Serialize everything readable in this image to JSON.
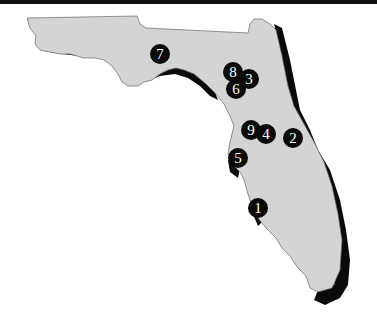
{
  "map": {
    "region": "Florida",
    "colors": {
      "land": "#d4d4d4",
      "shadow": "#0a0a0a",
      "outline": "#666666",
      "marker": "#0a0a0a",
      "marker_text": "#ffffff",
      "top_bar": "#111111"
    },
    "markers": [
      {
        "label": "1",
        "x": 258,
        "y": 208
      },
      {
        "label": "2",
        "x": 293,
        "y": 138
      },
      {
        "label": "3",
        "x": 249,
        "y": 79
      },
      {
        "label": "4",
        "x": 266,
        "y": 134
      },
      {
        "label": "5",
        "x": 238,
        "y": 158
      },
      {
        "label": "6",
        "x": 236,
        "y": 89
      },
      {
        "label": "7",
        "x": 160,
        "y": 54
      },
      {
        "label": "8",
        "x": 233,
        "y": 72
      },
      {
        "label": "9",
        "x": 251,
        "y": 130
      }
    ]
  }
}
